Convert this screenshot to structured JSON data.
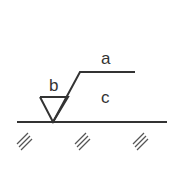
{
  "diagram": {
    "type": "surface-roughness-symbol",
    "labels": {
      "a": "a",
      "b": "b",
      "c": "c"
    },
    "colors": {
      "stroke": "#333333",
      "hatch": "#555555",
      "background": "#ffffff"
    }
  }
}
